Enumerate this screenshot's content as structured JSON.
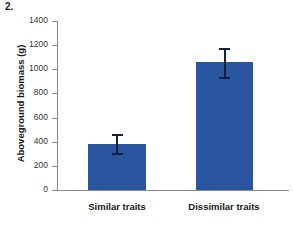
{
  "figure": {
    "number_label": "2."
  },
  "chart_data": {
    "type": "bar",
    "title": "",
    "xlabel": "",
    "ylabel": "Aboveground biomass (g)",
    "categories": [
      "Similar traits",
      "Dissimilar traits"
    ],
    "values": [
      385,
      1060
    ],
    "errors": [
      80,
      120
    ],
    "error_type": "symmetric",
    "ylim": [
      0,
      1400
    ],
    "yticks": [
      0,
      200,
      400,
      600,
      800,
      1000,
      1200,
      1400
    ],
    "ytick_labels": [
      "0",
      "200",
      "400",
      "600",
      "800",
      "1000",
      "1200",
      "1400"
    ],
    "grid": false,
    "legend": false,
    "legend_position": "none",
    "colors": {
      "bar": "#2a56a0",
      "error_bar": "#14213d",
      "axis": "#8a8a8a",
      "text": "#1a1a1a",
      "background": "#ffffff"
    }
  }
}
